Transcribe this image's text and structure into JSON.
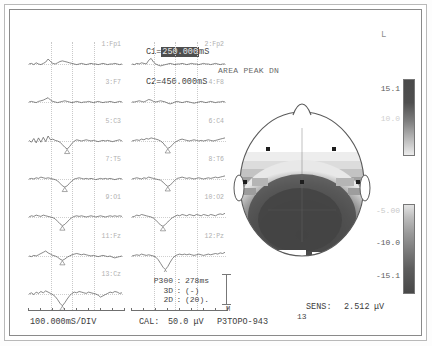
{
  "window": {
    "title": "P3TOPO-943",
    "orientation_label": "L"
  },
  "cursors": {
    "c1_label": "C1=",
    "c1_value": "250.000",
    "c1_unit": "mS",
    "c2_label": "C2=",
    "c2_value": "450.000",
    "c2_unit": "mS"
  },
  "map_header": {
    "mode": "AREA PEAK DN"
  },
  "channels": [
    {
      "index": 1,
      "label": "1:Fp1"
    },
    {
      "index": 2,
      "label": "2:Fp2"
    },
    {
      "index": 3,
      "label": "3:F7"
    },
    {
      "index": 4,
      "label": "4:F8"
    },
    {
      "index": 5,
      "label": "5:C3"
    },
    {
      "index": 6,
      "label": "6:C4"
    },
    {
      "index": 7,
      "label": "7:T5"
    },
    {
      "index": 8,
      "label": "8:T6"
    },
    {
      "index": 9,
      "label": "9:O1"
    },
    {
      "index": 10,
      "label": "10:O2"
    },
    {
      "index": 11,
      "label": "11:Fz"
    },
    {
      "index": 12,
      "label": "12:Pz"
    },
    {
      "index": 13,
      "label": "13:Cz"
    }
  ],
  "measurements": {
    "rows": [
      {
        "name": "P300",
        "sep": ":",
        "value": "278ms"
      },
      {
        "name": "3D",
        "sep": ":",
        "value": "(-)"
      },
      {
        "name": "2D",
        "sep": ":",
        "value": "(20)."
      }
    ]
  },
  "axes": {
    "time_per_div": "100.000mS/DIV",
    "cal_label": "CAL:",
    "cal_value": "50.0 μV",
    "marker": "M"
  },
  "colorbar": {
    "ticks_top": [
      "15.1",
      "10.0"
    ],
    "ticks_bottom": [
      "-5.00",
      "-10.0",
      "-15.1"
    ]
  },
  "sensitivity": {
    "label": "SENS:",
    "value": "2.512",
    "unit": "μV",
    "channel_count": "13"
  },
  "chart_data": {
    "type": "line",
    "xlabel": "Time (mS)",
    "ylabel": "Amplitude (μV)",
    "xlim": [
      0,
      800
    ],
    "ylim": [
      -50,
      50
    ],
    "grid": true,
    "legend": "none",
    "annotations": [
      {
        "text": "C1 = 250.000 mS",
        "type": "cursor"
      },
      {
        "text": "C2 = 450.000 mS",
        "type": "cursor"
      },
      {
        "text": "P300 latency 278 ms",
        "type": "peak-marker"
      }
    ],
    "series": [
      {
        "name": "1:Fp1",
        "values": [
          0,
          1,
          -1,
          2,
          0,
          -1,
          1,
          3,
          8,
          4,
          1,
          0,
          2,
          4,
          5,
          4,
          3,
          2,
          1,
          0,
          -1,
          0,
          1,
          0,
          -1,
          0,
          1,
          0,
          0,
          -1,
          0,
          1,
          0,
          -1,
          0,
          0,
          1,
          0,
          -1,
          0
        ]
      },
      {
        "name": "2:Fp2",
        "values": [
          0,
          -1,
          1,
          0,
          2,
          1,
          0,
          6,
          9,
          3,
          0,
          -2,
          -3,
          -2,
          -1,
          0,
          1,
          0,
          -1,
          0,
          0,
          1,
          0,
          -1,
          0,
          1,
          0,
          0,
          -1,
          0,
          1,
          0,
          0,
          -1,
          0,
          1,
          0,
          -1,
          0,
          0
        ]
      },
      {
        "name": "3:F7",
        "values": [
          0,
          1,
          0,
          -1,
          1,
          2,
          3,
          5,
          7,
          3,
          1,
          0,
          -1,
          0,
          1,
          2,
          1,
          0,
          -1,
          0,
          1,
          0,
          -1,
          0,
          0,
          1,
          0,
          -1,
          0,
          1,
          0,
          -1,
          0,
          0,
          1,
          0,
          -1,
          0,
          1,
          0
        ]
      },
      {
        "name": "4:F8",
        "values": [
          0,
          0,
          1,
          2,
          1,
          0,
          2,
          4,
          3,
          1,
          0,
          1,
          2,
          1,
          0,
          -2,
          -3,
          -2,
          0,
          1,
          0,
          -1,
          0,
          1,
          0,
          -1,
          -2,
          -1,
          0,
          1,
          0,
          -1,
          0,
          1,
          0,
          -1,
          0,
          0,
          1,
          0
        ]
      },
      {
        "name": "5:C3",
        "values": [
          1,
          -2,
          4,
          -3,
          5,
          -2,
          6,
          -1,
          8,
          2,
          3,
          1,
          0,
          -2,
          -6,
          -10,
          -13,
          -9,
          -4,
          0,
          2,
          1,
          0,
          1,
          2,
          1,
          0,
          1,
          0,
          -1,
          0,
          1,
          0,
          1,
          0,
          -1,
          0,
          1,
          2,
          0
        ]
      },
      {
        "name": "6:C4",
        "values": [
          0,
          1,
          2,
          1,
          3,
          2,
          4,
          3,
          5,
          4,
          3,
          2,
          0,
          -3,
          -8,
          -12,
          -10,
          -6,
          -2,
          0,
          2,
          3,
          2,
          1,
          0,
          1,
          2,
          1,
          0,
          1,
          0,
          1,
          2,
          1,
          0,
          1,
          2,
          3,
          4,
          5
        ]
      },
      {
        "name": "7:T5",
        "values": [
          0,
          1,
          0,
          2,
          1,
          3,
          2,
          1,
          2,
          1,
          0,
          -1,
          -3,
          -7,
          -11,
          -13,
          -11,
          -7,
          -3,
          0,
          1,
          2,
          1,
          0,
          1,
          0,
          1,
          0,
          -1,
          0,
          1,
          0,
          1,
          0,
          1,
          0,
          -1,
          0,
          1,
          0
        ]
      },
      {
        "name": "8:T6",
        "values": [
          0,
          1,
          2,
          1,
          0,
          2,
          1,
          3,
          2,
          1,
          0,
          -1,
          -2,
          -5,
          -9,
          -12,
          -10,
          -6,
          -2,
          1,
          2,
          3,
          2,
          1,
          2,
          1,
          0,
          1,
          2,
          1,
          0,
          1,
          2,
          1,
          2,
          3,
          2,
          3,
          4,
          5
        ]
      },
      {
        "name": "9:O1",
        "values": [
          0,
          2,
          1,
          3,
          2,
          1,
          3,
          2,
          1,
          0,
          -1,
          -3,
          -7,
          -11,
          -14,
          -12,
          -8,
          -4,
          -1,
          1,
          2,
          1,
          2,
          1,
          0,
          1,
          2,
          1,
          0,
          1,
          2,
          1,
          0,
          1,
          2,
          1,
          2,
          1,
          2,
          1
        ]
      },
      {
        "name": "10:O2",
        "values": [
          0,
          1,
          3,
          2,
          4,
          3,
          2,
          1,
          0,
          -2,
          -5,
          -9,
          -13,
          -15,
          -12,
          -8,
          -4,
          -1,
          1,
          3,
          2,
          4,
          3,
          2,
          4,
          3,
          2,
          4,
          3,
          2,
          4,
          3,
          2,
          4,
          3,
          2,
          4,
          5,
          4,
          6
        ]
      },
      {
        "name": "11:Fz",
        "values": [
          0,
          -1,
          1,
          0,
          2,
          4,
          6,
          8,
          5,
          3,
          1,
          0,
          -2,
          -5,
          -7,
          -5,
          -2,
          0,
          2,
          3,
          4,
          3,
          2,
          3,
          2,
          1,
          0,
          1,
          0,
          -1,
          0,
          1,
          0,
          -1,
          0,
          -2,
          -3,
          -2,
          -1,
          0
        ]
      },
      {
        "name": "12:Pz",
        "values": [
          0,
          1,
          2,
          1,
          3,
          2,
          1,
          2,
          1,
          0,
          -2,
          -6,
          -12,
          -18,
          -22,
          -17,
          -10,
          -4,
          0,
          2,
          3,
          2,
          3,
          2,
          3,
          2,
          1,
          2,
          3,
          2,
          1,
          2,
          3,
          2,
          3,
          4,
          3,
          5,
          4,
          6
        ]
      },
      {
        "name": "13:Cz",
        "values": [
          0,
          2,
          -1,
          3,
          1,
          4,
          2,
          5,
          3,
          1,
          -1,
          -4,
          -9,
          -15,
          -19,
          -14,
          -8,
          -3,
          1,
          3,
          2,
          4,
          3,
          2,
          1,
          3,
          2,
          1,
          0,
          -2,
          -5,
          -3,
          -1,
          1,
          3,
          2,
          4,
          3,
          1,
          2
        ]
      }
    ]
  }
}
